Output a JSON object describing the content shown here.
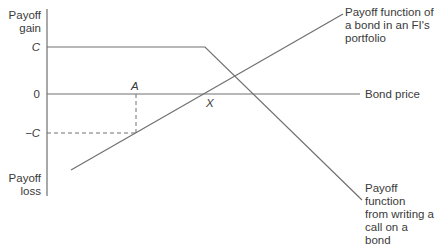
{
  "axis": {
    "y_top_label_line1": "Payoff",
    "y_top_label_line2": "gain",
    "y_bottom_label_line1": "Payoff",
    "y_bottom_label_line2": "loss",
    "x_label": "Bond price",
    "tick_c": "C",
    "tick_zero": "0",
    "tick_neg_c": "−C"
  },
  "points": {
    "a": "A",
    "x": "X"
  },
  "annotations": {
    "bond_line1": "Payoff function of",
    "bond_line2": "a bond in an FI's",
    "bond_line3": "portfolio",
    "call_line1": "Payoff function",
    "call_line2": "from writing a",
    "call_line3": "call on a bond"
  },
  "colors": {
    "line": "#707070",
    "text": "#3a3a3a"
  }
}
